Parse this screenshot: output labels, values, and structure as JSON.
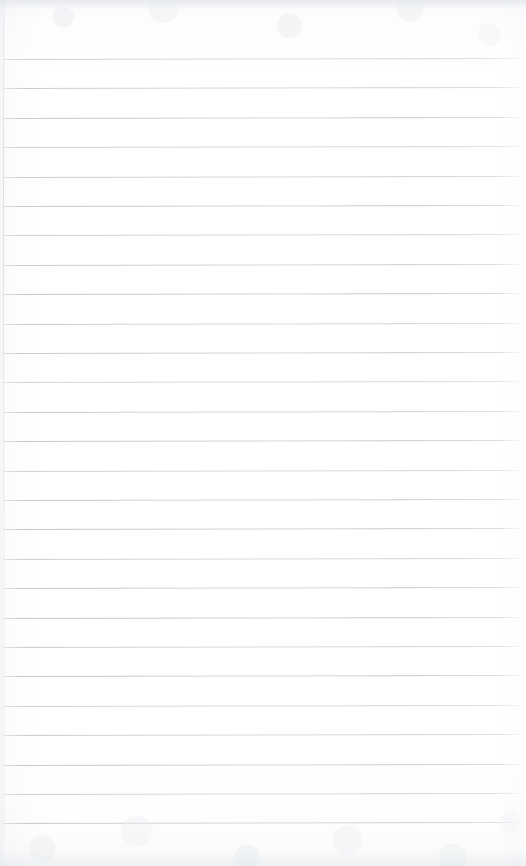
{
  "document": {
    "kind": "scanned-paper",
    "title": "Blank ruled notebook page",
    "description": "A scanned blank sheet of lined notebook paper with no handwriting, printing or markings.",
    "page_width": 526,
    "page_height": 866,
    "paper_color": "#fdfdfd",
    "rule_color": "#c0c6d0",
    "edge_color": "#e6e9ec"
  },
  "ruling": {
    "style": "wide-ruled-horizontal",
    "line_count": 26,
    "first_line_y": 59,
    "line_spacing": 29.4,
    "line_thickness": 1,
    "line_start_x": 3,
    "line_end_x": 520,
    "skew_degrees": -0.12,
    "has_margin_rule": false,
    "lines_y": [
      59,
      88.4,
      117.8,
      147.2,
      176.6,
      206,
      235.4,
      264.8,
      294.2,
      323.6,
      353,
      382.4,
      411.8,
      441.2,
      470.6,
      500,
      529.4,
      558.8,
      588.2,
      617.6,
      647,
      676.4,
      705.8,
      735.2,
      764.6,
      794,
      823.4
    ]
  },
  "content": {
    "text": "",
    "is_blank": true,
    "written_lines": []
  },
  "margins": {
    "top_blank_height": 59,
    "bottom_blank_height": 43,
    "left_edge_x": 3,
    "right_blank_width": 6
  }
}
